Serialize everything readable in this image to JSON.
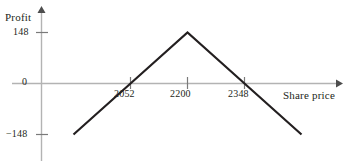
{
  "chart_data": {
    "type": "line",
    "title": "",
    "subtitle": "",
    "xlabel": "Share price",
    "ylabel": "Profit",
    "grid": false,
    "legend": null,
    "xlim": [
      1904,
      2496
    ],
    "ylim": [
      -222,
      200
    ],
    "x_ticks": [
      2052,
      2200,
      2348
    ],
    "x_tick_labels": [
      "2052",
      "2200",
      "2348"
    ],
    "y_ticks": [
      148,
      0,
      -148
    ],
    "y_tick_labels": [
      "148",
      "0",
      "−148"
    ],
    "x_axis_arrow": true,
    "y_axis_arrow": true,
    "series": [
      {
        "name": "Profit",
        "x": [
          1904,
          2052,
          2200,
          2348,
          2496
        ],
        "y": [
          -148,
          0,
          148,
          0,
          -148
        ]
      }
    ],
    "annotations": [],
    "colors": {
      "curve": "#231f20",
      "axis": "#b3b3b3",
      "tick_mark": "#7a7a7a",
      "text": "#231f20",
      "background": "#ffffff"
    }
  },
  "labels": {
    "y_axis_title": "Profit",
    "x_axis_title": "Share price",
    "y_tick_top": "148",
    "y_tick_zero": "0",
    "y_tick_bottom": "−148",
    "x_tick_left": "2052",
    "x_tick_mid": "2200",
    "x_tick_right": "2348"
  },
  "icons": {
    "y_axis_arrow": "arrow-up-icon",
    "x_axis_arrow": "arrow-right-icon"
  }
}
